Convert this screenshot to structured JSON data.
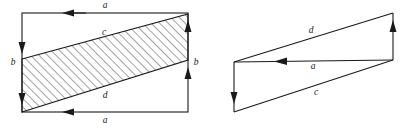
{
  "figure": {
    "type": "geometry-diagram",
    "background_color": "#ffffff",
    "stroke_color": "#1a1a1a",
    "hatch_color": "#333333",
    "panels": [
      {
        "name": "left-panel",
        "shape": "rectangle-with-hatched-parallelogram",
        "rect": {
          "left": 22,
          "top": 13,
          "right": 188,
          "bottom": 112
        },
        "parallelogram": {
          "points": "22,59 188,14 188,60 22,112",
          "fill": "hatched-45-degree"
        },
        "labels": [
          {
            "name": "label-a-top",
            "text": "a",
            "x": 105,
            "y": 6
          },
          {
            "name": "label-c",
            "text": "c",
            "x": 104,
            "y": 33
          },
          {
            "name": "label-b-left",
            "text": "b",
            "x": 13,
            "y": 63
          },
          {
            "name": "label-b-right",
            "text": "b",
            "x": 196,
            "y": 63
          },
          {
            "name": "label-d",
            "text": "d",
            "x": 105,
            "y": 96
          },
          {
            "name": "label-a-bottom",
            "text": "a",
            "x": 105,
            "y": 121
          }
        ],
        "arrows": [
          {
            "name": "arrow-a-top",
            "label": "a",
            "direction": "leftward",
            "on": "rectangle-top-edge"
          },
          {
            "name": "arrow-b-left",
            "label": "b",
            "direction": "downward",
            "on": "rectangle-left-edge"
          },
          {
            "name": "arrow-b-left-2",
            "label": "b",
            "direction": "downward",
            "on": "rectangle-left-edge"
          },
          {
            "name": "arrow-b-right",
            "label": "b",
            "direction": "upward",
            "on": "rectangle-right-edge"
          },
          {
            "name": "arrow-b-right-2",
            "label": "b",
            "direction": "upward",
            "on": "rectangle-right-edge"
          },
          {
            "name": "arrow-a-bottom",
            "label": "a",
            "direction": "leftward",
            "on": "rectangle-bottom-edge"
          }
        ]
      },
      {
        "name": "right-panel",
        "shape": "vector-quadrilateral",
        "vertices": {
          "left_top": {
            "x": 234,
            "y": 62
          },
          "left_bottom": {
            "x": 234,
            "y": 112
          },
          "right_top": {
            "x": 393,
            "y": 13
          },
          "right_bottom": {
            "x": 393,
            "y": 60
          }
        },
        "labels": [
          {
            "name": "label-d",
            "text": "d",
            "x": 311,
            "y": 31
          },
          {
            "name": "label-a",
            "text": "a",
            "x": 313,
            "y": 67
          },
          {
            "name": "label-c",
            "text": "c",
            "x": 316,
            "y": 93
          }
        ],
        "arrows": [
          {
            "name": "arrow-d",
            "label": "d",
            "direction": "up-right",
            "on": "top-edge"
          },
          {
            "name": "arrow-a",
            "label": "a",
            "direction": "leftward",
            "on": "middle-edge"
          },
          {
            "name": "arrow-c",
            "label": "c",
            "direction": "downward",
            "on": "left-edge"
          },
          {
            "name": "arrow-b",
            "label": "b",
            "direction": "upward",
            "on": "right-edge"
          }
        ]
      }
    ]
  }
}
